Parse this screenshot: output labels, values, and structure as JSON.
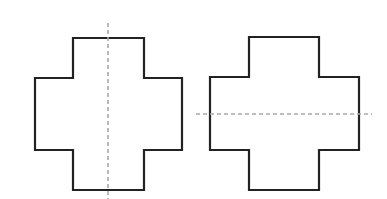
{
  "diagram": {
    "colors": {
      "outline": "#222222",
      "symmetry_line": "#a9a9a9",
      "background": "#ffffff"
    },
    "figures": [
      {
        "id": "left-cross",
        "points": "73,38 144,38 144,78 182,78 182,150 144,150 144,190 73,190 73,150 35,150 35,78 73,78",
        "symmetry_line": {
          "orientation": "vertical",
          "x1": 108,
          "y1": 23,
          "x2": 108,
          "y2": 199
        }
      },
      {
        "id": "right-cross",
        "points": "249,37 319,37 319,77 359,77 359,150 319,150 319,190 249,190 249,150 210,150 210,77 249,77",
        "symmetry_line": {
          "orientation": "horizontal",
          "x1": 196,
          "y1": 114,
          "x2": 372,
          "y2": 114
        }
      }
    ]
  }
}
